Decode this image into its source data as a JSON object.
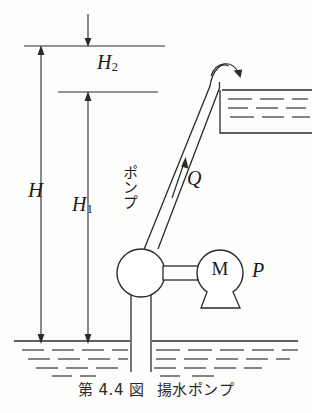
{
  "figure": {
    "caption_number": "第 4.4 図",
    "caption_title": "揚水ポンプ",
    "background_color": "#fdfdfc",
    "line_color": "#2b2b2b"
  },
  "labels": {
    "total_head": "H",
    "static_head_lower": "H",
    "static_head_lower_sub": "1",
    "static_head_upper": "H",
    "static_head_upper_sub": "2",
    "flow_rate": "Q",
    "motor": "M",
    "power": "P",
    "pump_jp": "ポンプ"
  },
  "components": {
    "pump_label": "pump-body",
    "motor_label": "motor",
    "discharge_pipe_label": "discharge-pipe",
    "suction_pipe_label": "suction-pipe",
    "upper_tank_label": "upper-reservoir",
    "lower_water_label": "lower-water-body"
  },
  "dimensions": {
    "top_reference_line": "upper water surface reference",
    "mid_reference_line": "pump centerline reference",
    "bottom_reference_line": "lower water surface"
  }
}
